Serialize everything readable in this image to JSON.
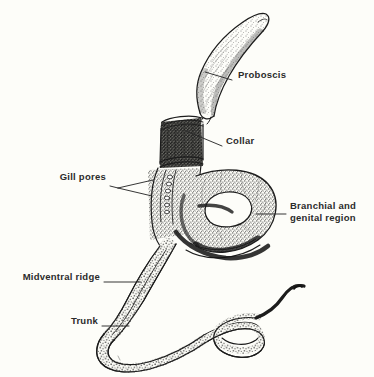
{
  "figure": {
    "organism_group": "hemichordate",
    "background_color": "#fdfdf9",
    "ink_color": "#1c1c1c",
    "label_color": "#2b2b2b",
    "width": 374,
    "height": 377
  },
  "labels": [
    {
      "id": "proboscis",
      "text": "Proboscis",
      "side": "right",
      "lines": [
        "Proboscis"
      ],
      "text_x": 242,
      "text_y": 75,
      "leader": {
        "x1": 232,
        "y1": 80,
        "x2": 205,
        "y2": 72
      }
    },
    {
      "id": "collar",
      "text": "Collar",
      "side": "right",
      "lines": [
        "Collar"
      ],
      "text_x": 226,
      "text_y": 141,
      "leader": {
        "x1": 222,
        "y1": 146,
        "x2": 186,
        "y2": 131
      }
    },
    {
      "id": "gill-pores",
      "text": "Gill pores",
      "side": "left",
      "lines": [
        "Gill pores"
      ],
      "text_x": 57,
      "text_y": 177,
      "leader_fork": {
        "hub_x": 118,
        "hub_y": 188,
        "stem_x": 110,
        "stem_y": 185,
        "branch_a": {
          "x": 153,
          "y": 180
        },
        "branch_b": {
          "x": 152,
          "y": 196
        }
      }
    },
    {
      "id": "branchial-and-genital-region",
      "text": "Branchial and genital region",
      "side": "right",
      "lines": [
        "Branchial and",
        "genital region"
      ],
      "text_x": 290,
      "text_y": 206,
      "leader": {
        "x1": 286,
        "y1": 214,
        "x2": 256,
        "y2": 214
      }
    },
    {
      "id": "midventral-ridge",
      "text": "Midventral ridge",
      "side": "left",
      "lines": [
        "Midventral ridge"
      ],
      "text_x": 16,
      "text_y": 277,
      "leader": {
        "x1": 104,
        "y1": 282,
        "x2": 141,
        "y2": 282
      }
    },
    {
      "id": "trunk",
      "text": "Trunk",
      "side": "left",
      "lines": [
        "Trunk"
      ],
      "text_x": 68,
      "text_y": 321,
      "leader": {
        "x1": 102,
        "y1": 326,
        "x2": 129,
        "y2": 326
      }
    }
  ],
  "anatomy_parts": [
    {
      "id": "proboscis",
      "label": "Proboscis",
      "description": "elongate tapering conical organ curving up to the right, finely stippled"
    },
    {
      "id": "collar",
      "label": "Collar",
      "description": "short dark cylindrical band with ridged rims behind the proboscis"
    },
    {
      "id": "gill-pores",
      "label": "Gill pores",
      "description": "vertical series of small oval openings on the branchial trunk"
    },
    {
      "id": "branchial-genital-region",
      "label": "Branchial and genital region",
      "description": "broad looped body region forming an enclosed oval opening"
    },
    {
      "id": "midventral-ridge",
      "label": "Midventral ridge",
      "description": "longitudinal ridge line running along the trunk"
    },
    {
      "id": "trunk",
      "label": "Trunk",
      "description": "long serpentine posterior body coiling and tapering to a thin tail"
    }
  ]
}
